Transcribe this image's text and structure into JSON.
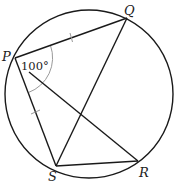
{
  "diagram": {
    "type": "circle-geometry",
    "circle": {
      "cx": 89,
      "cy": 94,
      "r": 84
    },
    "points": {
      "P": {
        "label": "P",
        "x": 15,
        "y": 58
      },
      "Q": {
        "label": "Q",
        "x": 127,
        "y": 18
      },
      "R": {
        "label": "R",
        "x": 138,
        "y": 161
      },
      "S": {
        "label": "S",
        "x": 56,
        "y": 166
      }
    },
    "segments": [
      "PQ",
      "PS",
      "PR",
      "QS",
      "SR"
    ],
    "equal_marks": [
      "PQ",
      "PS"
    ],
    "angle": {
      "vertex": "P",
      "between": [
        "Q",
        "S"
      ],
      "value": "100°"
    },
    "colors": {
      "stroke": "#1a1a1a",
      "marks": "#9a9a9a",
      "background": "#ffffff"
    }
  }
}
